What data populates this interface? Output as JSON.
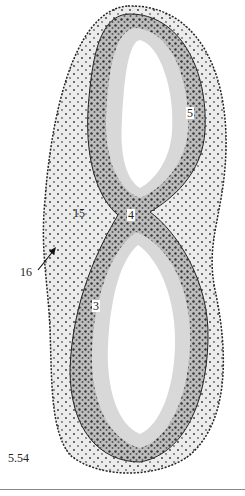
{
  "figure": {
    "number": "5.54",
    "colors": {
      "tissue_dark": "#3a3a3a",
      "tissue_mid": "#9a9a9a",
      "tissue_light": "#d8d8d8",
      "background": "#ffffff"
    },
    "labels": [
      {
        "id": "5",
        "text": "5",
        "x": 186,
        "y": 113,
        "boxed": true
      },
      {
        "id": "4",
        "text": "4",
        "x": 127,
        "y": 215,
        "boxed": true
      },
      {
        "id": "15",
        "text": "15",
        "x": 73,
        "y": 213,
        "boxed": false
      },
      {
        "id": "16",
        "text": "16",
        "x": 22,
        "y": 272,
        "boxed": false
      },
      {
        "id": "3",
        "text": "3",
        "x": 92,
        "y": 306,
        "boxed": true
      }
    ],
    "arrow": {
      "from_label": "16",
      "x1": 38,
      "y1": 270,
      "x2": 54,
      "y2": 250
    }
  }
}
